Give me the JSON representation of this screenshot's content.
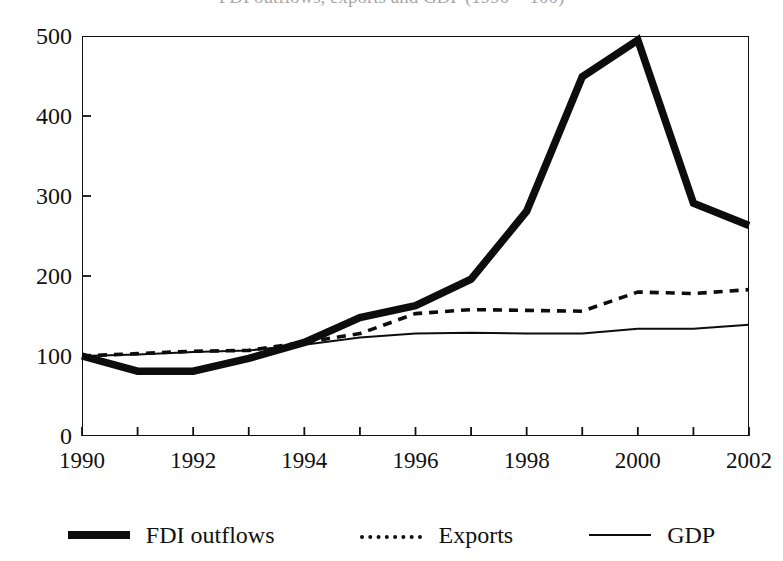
{
  "chart_data": {
    "type": "line",
    "title": "FDI outflows, exports and GDP (1990 = 100)",
    "xlabel": "",
    "ylabel": "",
    "x": [
      1990,
      1991,
      1992,
      1993,
      1994,
      1995,
      1996,
      1997,
      1998,
      1999,
      2000,
      2001,
      2002
    ],
    "xlim": [
      1990,
      2002
    ],
    "ylim": [
      0,
      500
    ],
    "yticks": [
      0,
      100,
      200,
      300,
      400,
      500
    ],
    "ytick_labels": [
      "0",
      "100",
      "200",
      "300",
      "400",
      "500"
    ],
    "xticks": [
      1990,
      1991,
      1992,
      1993,
      1994,
      1995,
      1996,
      1997,
      1998,
      1999,
      2000,
      2001,
      2002
    ],
    "xtick_labels": [
      "1990",
      "",
      "1992",
      "",
      "1994",
      "",
      "1996",
      "",
      "1998",
      "",
      "2000",
      "",
      "2002"
    ],
    "grid": false,
    "legend_position": "bottom",
    "series": [
      {
        "name": "FDI outflows",
        "style": "thick-solid",
        "color": "#0d0d0d",
        "values": [
          100,
          81,
          81,
          97,
          117,
          148,
          163,
          196,
          281,
          449,
          495,
          291,
          263
        ]
      },
      {
        "name": "Exports",
        "style": "dashed",
        "color": "#0d0d0d",
        "values": [
          100,
          103,
          106,
          107,
          117,
          128,
          153,
          158,
          157,
          156,
          180,
          178,
          183
        ]
      },
      {
        "name": "GDP",
        "style": "thin-solid",
        "color": "#0d0d0d",
        "values": [
          100,
          102,
          105,
          107,
          114,
          123,
          128,
          129,
          128,
          128,
          134,
          134,
          139
        ]
      }
    ]
  },
  "legend": {
    "items": [
      {
        "label": "FDI outflows",
        "swatch": "thick-solid-swatch"
      },
      {
        "label": "Exports",
        "swatch": "dashed-swatch"
      },
      {
        "label": "GDP",
        "swatch": "thin-solid-swatch"
      }
    ]
  }
}
